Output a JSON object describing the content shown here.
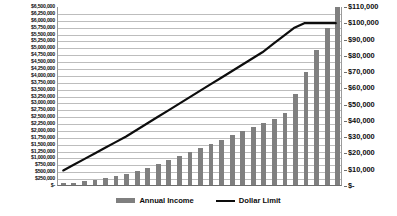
{
  "chart_data": {
    "type": "bar",
    "title": "",
    "subtitle": "",
    "xlabel": "",
    "ylabel": "",
    "grid": true,
    "legend_position": "bottom-center",
    "categories": [
      "1",
      "2",
      "3",
      "4",
      "5",
      "6",
      "7",
      "8",
      "9",
      "10",
      "11",
      "12",
      "13",
      "14",
      "15",
      "16",
      "17",
      "18",
      "19",
      "20",
      "21",
      "22",
      "23",
      "24",
      "25",
      "26",
      "27"
    ],
    "series": [
      {
        "name": "Annual Income",
        "type": "bar",
        "axis": "left",
        "color": "#7f7f7f",
        "values": [
          60000,
          90000,
          130000,
          180000,
          240000,
          310000,
          400000,
          500000,
          620000,
          760000,
          900000,
          1050000,
          1200000,
          1350000,
          1500000,
          1650000,
          1800000,
          1950000,
          2100000,
          2250000,
          2400000,
          2600000,
          3300000,
          4100000,
          4900000,
          5700000,
          6450000
        ]
      },
      {
        "name": "Dollar Limit",
        "type": "line",
        "axis": "right",
        "color": "#0d0d0d",
        "values": [
          9000,
          12500,
          16000,
          19500,
          23000,
          26500,
          30000,
          34000,
          38000,
          42000,
          46000,
          50000,
          54000,
          58000,
          62000,
          66000,
          70000,
          74000,
          78000,
          82000,
          87000,
          92000,
          97000,
          100000,
          100000,
          100000,
          100000
        ]
      }
    ],
    "left_axis": {
      "min": 0,
      "max": 6500000,
      "step": 250000,
      "tick_labels": [
        "$6,500,000",
        "$6,250,000",
        "$6,000,000",
        "$5,750,000",
        "$5,500,000",
        "$5,250,000",
        "$5,000,000",
        "$4,750,000",
        "$4,500,000",
        "$4,250,000",
        "$4,000,000",
        "$3,750,000",
        "$3,500,000",
        "$3,250,000",
        "$3,000,000",
        "$2,750,000",
        "$2,500,000",
        "$2,250,000",
        "$2,000,000",
        "$1,750,000",
        "$1,500,000",
        "$1,250,000",
        "$1,000,000",
        "$750,000",
        "$500,000",
        "$250,000",
        "$-"
      ]
    },
    "right_axis": {
      "min": 0,
      "max": 110000,
      "step": 10000,
      "tick_labels": [
        "$110,000",
        "$100,000",
        "$90,000",
        "$80,000",
        "$70,000",
        "$60,000",
        "$50,000",
        "$40,000",
        "$30,000",
        "$20,000",
        "$10,000",
        "$-"
      ]
    }
  },
  "legend": {
    "items": [
      {
        "label": "Annual Income",
        "marker": "bar-swatch",
        "color": "#7f7f7f"
      },
      {
        "label": "Dollar Limit",
        "marker": "line-swatch",
        "color": "#0d0d0d"
      }
    ]
  }
}
